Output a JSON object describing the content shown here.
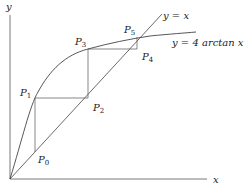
{
  "figure": {
    "axis_x_label": "x",
    "axis_y_label": "y",
    "line_label": "y = x",
    "curve_label": "y = 4 arctan x",
    "points": [
      {
        "name": "P",
        "sub": "0"
      },
      {
        "name": "P",
        "sub": "1"
      },
      {
        "name": "P",
        "sub": "2"
      },
      {
        "name": "P",
        "sub": "3"
      },
      {
        "name": "P",
        "sub": "4"
      },
      {
        "name": "P",
        "sub": "5"
      }
    ],
    "colors": {
      "stroke": "#333333",
      "background": "#ffffff"
    }
  }
}
